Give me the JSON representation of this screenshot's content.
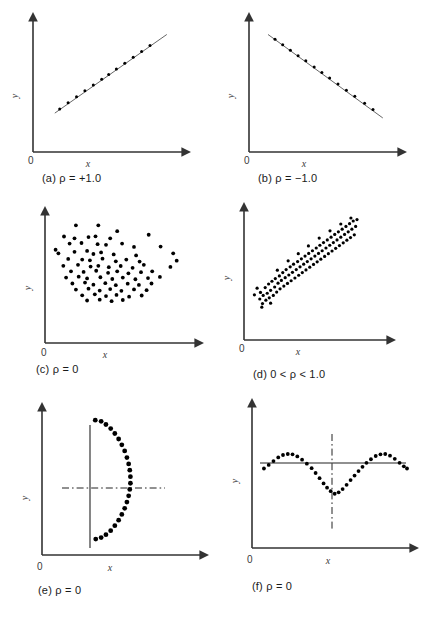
{
  "figure": {
    "title": "",
    "panel_count": 6
  },
  "chart_data": [
    {
      "type": "scatter",
      "panel": "a",
      "caption": "(a) ρ = +1.0",
      "title": "",
      "xlabel": "x",
      "ylabel": "y",
      "origin_label": "0",
      "grid": false,
      "legend": false,
      "has_trendline": true,
      "trendline": {
        "x0": 0.12,
        "y0": 0.28,
        "x1": 0.92,
        "y1": 0.93
      },
      "xlim": [
        0,
        1
      ],
      "ylim": [
        0,
        1
      ],
      "points": [
        [
          0.155,
          0.315
        ],
        [
          0.215,
          0.365
        ],
        [
          0.275,
          0.415
        ],
        [
          0.335,
          0.465
        ],
        [
          0.395,
          0.512
        ],
        [
          0.455,
          0.56
        ],
        [
          0.505,
          0.6
        ],
        [
          0.56,
          0.645
        ],
        [
          0.62,
          0.693
        ],
        [
          0.68,
          0.742
        ],
        [
          0.74,
          0.79
        ],
        [
          0.8,
          0.838
        ]
      ]
    },
    {
      "type": "scatter",
      "panel": "b",
      "caption": "(b) ρ = −1.0",
      "title": "",
      "xlabel": "x",
      "ylabel": "y",
      "origin_label": "0",
      "grid": false,
      "legend": false,
      "has_trendline": true,
      "trendline": {
        "x0": 0.1,
        "y0": 0.93,
        "x1": 0.92,
        "y1": 0.24
      },
      "xlim": [
        0,
        1
      ],
      "ylim": [
        0,
        1
      ],
      "points": [
        [
          0.15,
          0.89
        ],
        [
          0.205,
          0.845
        ],
        [
          0.26,
          0.8
        ],
        [
          0.315,
          0.755
        ],
        [
          0.37,
          0.712
        ],
        [
          0.43,
          0.662
        ],
        [
          0.485,
          0.616
        ],
        [
          0.54,
          0.57
        ],
        [
          0.6,
          0.52
        ],
        [
          0.66,
          0.47
        ],
        [
          0.72,
          0.42
        ],
        [
          0.79,
          0.362
        ],
        [
          0.85,
          0.31
        ]
      ]
    },
    {
      "type": "scatter",
      "panel": "c",
      "caption": "(c) ρ = 0",
      "title": "",
      "xlabel": "x",
      "ylabel": "y",
      "origin_label": "0",
      "grid": false,
      "legend": false,
      "has_trendline": false,
      "xlim": [
        0,
        1
      ],
      "ylim": [
        0,
        1
      ],
      "points": [
        [
          0.185,
          0.955
        ],
        [
          0.345,
          0.955
        ],
        [
          0.48,
          0.905
        ],
        [
          0.705,
          0.875
        ],
        [
          0.1,
          0.86
        ],
        [
          0.175,
          0.845
        ],
        [
          0.275,
          0.855
        ],
        [
          0.325,
          0.862
        ],
        [
          0.43,
          0.845
        ],
        [
          0.14,
          0.8
        ],
        [
          0.225,
          0.805
        ],
        [
          0.34,
          0.795
        ],
        [
          0.4,
          0.79
        ],
        [
          0.515,
          0.8
        ],
        [
          0.6,
          0.772
        ],
        [
          0.79,
          0.775
        ],
        [
          0.04,
          0.748
        ],
        [
          0.06,
          0.718
        ],
        [
          0.175,
          0.73
        ],
        [
          0.265,
          0.738
        ],
        [
          0.31,
          0.712
        ],
        [
          0.365,
          0.725
        ],
        [
          0.455,
          0.708
        ],
        [
          0.615,
          0.7
        ],
        [
          0.88,
          0.718
        ],
        [
          0.13,
          0.67
        ],
        [
          0.23,
          0.665
        ],
        [
          0.285,
          0.658
        ],
        [
          0.375,
          0.672
        ],
        [
          0.47,
          0.65
        ],
        [
          0.545,
          0.665
        ],
        [
          0.64,
          0.648
        ],
        [
          0.905,
          0.655
        ],
        [
          0.095,
          0.612
        ],
        [
          0.2,
          0.62
        ],
        [
          0.29,
          0.605
        ],
        [
          0.345,
          0.612
        ],
        [
          0.42,
          0.6
        ],
        [
          0.505,
          0.61
        ],
        [
          0.59,
          0.595
        ],
        [
          0.67,
          0.62
        ],
        [
          0.86,
          0.602
        ],
        [
          0.15,
          0.565
        ],
        [
          0.24,
          0.56
        ],
        [
          0.33,
          0.57
        ],
        [
          0.415,
          0.552
        ],
        [
          0.48,
          0.565
        ],
        [
          0.56,
          0.548
        ],
        [
          0.65,
          0.558
        ],
        [
          0.73,
          0.565
        ],
        [
          0.115,
          0.512
        ],
        [
          0.205,
          0.52
        ],
        [
          0.265,
          0.505
        ],
        [
          0.36,
          0.515
        ],
        [
          0.445,
          0.5
        ],
        [
          0.52,
          0.512
        ],
        [
          0.61,
          0.498
        ],
        [
          0.7,
          0.508
        ],
        [
          0.785,
          0.518
        ],
        [
          0.16,
          0.462
        ],
        [
          0.25,
          0.47
        ],
        [
          0.31,
          0.452
        ],
        [
          0.395,
          0.465
        ],
        [
          0.47,
          0.448
        ],
        [
          0.555,
          0.46
        ],
        [
          0.635,
          0.45
        ],
        [
          0.725,
          0.462
        ],
        [
          0.185,
          0.41
        ],
        [
          0.275,
          0.418
        ],
        [
          0.355,
          0.402
        ],
        [
          0.43,
          0.415
        ],
        [
          0.51,
          0.4
        ],
        [
          0.6,
          0.412
        ],
        [
          0.69,
          0.405
        ],
        [
          0.23,
          0.362
        ],
        [
          0.32,
          0.37
        ],
        [
          0.4,
          0.355
        ],
        [
          0.475,
          0.365
        ],
        [
          0.565,
          0.35
        ],
        [
          0.655,
          0.36
        ],
        [
          0.265,
          0.318
        ],
        [
          0.355,
          0.325
        ],
        [
          0.44,
          0.312
        ],
        [
          0.52,
          0.322
        ]
      ]
    },
    {
      "type": "scatter",
      "panel": "d",
      "caption": "(d) 0 < ρ < 1.0",
      "title": "",
      "xlabel": "x",
      "ylabel": "y",
      "origin_label": "0",
      "grid": false,
      "legend": false,
      "has_trendline": false,
      "correlation_range": "0 < rho < 1.0",
      "xlim": [
        0,
        1
      ],
      "ylim": [
        0,
        1
      ],
      "points": [
        [
          0.08,
          0.3
        ],
        [
          0.085,
          0.355
        ],
        [
          0.1,
          0.262
        ],
        [
          0.105,
          0.33
        ],
        [
          0.12,
          0.395
        ],
        [
          0.125,
          0.29
        ],
        [
          0.135,
          0.348
        ],
        [
          0.145,
          0.425
        ],
        [
          0.15,
          0.31
        ],
        [
          0.16,
          0.372
        ],
        [
          0.17,
          0.448
        ],
        [
          0.18,
          0.33
        ],
        [
          0.19,
          0.4
        ],
        [
          0.195,
          0.47
        ],
        [
          0.205,
          0.358
        ],
        [
          0.215,
          0.432
        ],
        [
          0.225,
          0.492
        ],
        [
          0.23,
          0.385
        ],
        [
          0.24,
          0.455
        ],
        [
          0.25,
          0.52
        ],
        [
          0.258,
          0.408
        ],
        [
          0.268,
          0.478
        ],
        [
          0.275,
          0.545
        ],
        [
          0.285,
          0.43
        ],
        [
          0.295,
          0.5
        ],
        [
          0.305,
          0.568
        ],
        [
          0.312,
          0.452
        ],
        [
          0.322,
          0.522
        ],
        [
          0.33,
          0.59
        ],
        [
          0.34,
          0.475
        ],
        [
          0.35,
          0.545
        ],
        [
          0.36,
          0.612
        ],
        [
          0.368,
          0.498
        ],
        [
          0.378,
          0.568
        ],
        [
          0.388,
          0.635
        ],
        [
          0.395,
          0.52
        ],
        [
          0.405,
          0.59
        ],
        [
          0.415,
          0.658
        ],
        [
          0.422,
          0.542
        ],
        [
          0.432,
          0.612
        ],
        [
          0.442,
          0.68
        ],
        [
          0.45,
          0.565
        ],
        [
          0.46,
          0.635
        ],
        [
          0.47,
          0.702
        ],
        [
          0.478,
          0.588
        ],
        [
          0.488,
          0.658
        ],
        [
          0.498,
          0.725
        ],
        [
          0.505,
          0.61
        ],
        [
          0.515,
          0.68
        ],
        [
          0.525,
          0.748
        ],
        [
          0.532,
          0.632
        ],
        [
          0.542,
          0.702
        ],
        [
          0.552,
          0.77
        ],
        [
          0.56,
          0.655
        ],
        [
          0.57,
          0.725
        ],
        [
          0.58,
          0.792
        ],
        [
          0.588,
          0.678
        ],
        [
          0.598,
          0.748
        ],
        [
          0.608,
          0.815
        ],
        [
          0.615,
          0.7
        ],
        [
          0.625,
          0.77
        ],
        [
          0.635,
          0.838
        ],
        [
          0.642,
          0.722
        ],
        [
          0.652,
          0.792
        ],
        [
          0.662,
          0.86
        ],
        [
          0.67,
          0.745
        ],
        [
          0.68,
          0.815
        ],
        [
          0.69,
          0.882
        ],
        [
          0.698,
          0.768
        ],
        [
          0.708,
          0.838
        ],
        [
          0.718,
          0.905
        ],
        [
          0.725,
          0.79
        ],
        [
          0.735,
          0.86
        ],
        [
          0.745,
          0.928
        ],
        [
          0.752,
          0.812
        ],
        [
          0.762,
          0.882
        ],
        [
          0.772,
          0.95
        ],
        [
          0.78,
          0.835
        ],
        [
          0.79,
          0.905
        ],
        [
          0.8,
          0.962
        ],
        [
          0.04,
          0.335
        ],
        [
          0.06,
          0.39
        ],
        [
          0.21,
          0.54
        ],
        [
          0.29,
          0.618
        ],
        [
          0.365,
          0.678
        ],
        [
          0.44,
          0.742
        ],
        [
          0.52,
          0.808
        ],
        [
          0.6,
          0.868
        ],
        [
          0.68,
          0.925
        ],
        [
          0.755,
          0.975
        ],
        [
          0.16,
          0.265
        ],
        [
          0.095,
          0.232
        ]
      ]
    },
    {
      "type": "scatter",
      "panel": "e",
      "caption": "(e) ρ = 0",
      "title": "",
      "xlabel": "x",
      "ylabel": "y",
      "origin_label": "0",
      "grid": false,
      "legend": false,
      "has_trendline": false,
      "shape": "vertical-parabolic-arc",
      "reference_lines": [
        {
          "kind": "vertical-solid",
          "x": 0.33
        },
        {
          "kind": "horizontal-dashdot",
          "y": 0.52
        }
      ],
      "xlim": [
        0,
        1
      ],
      "ylim": [
        0,
        1
      ],
      "points": [
        [
          0.335,
          0.93
        ],
        [
          0.372,
          0.922
        ],
        [
          0.402,
          0.9
        ],
        [
          0.432,
          0.872
        ],
        [
          0.458,
          0.838
        ],
        [
          0.482,
          0.8
        ],
        [
          0.502,
          0.76
        ],
        [
          0.52,
          0.718
        ],
        [
          0.534,
          0.672
        ],
        [
          0.545,
          0.628
        ],
        [
          0.552,
          0.585
        ],
        [
          0.556,
          0.54
        ],
        [
          0.556,
          0.495
        ],
        [
          0.552,
          0.452
        ],
        [
          0.545,
          0.408
        ],
        [
          0.534,
          0.365
        ],
        [
          0.52,
          0.322
        ],
        [
          0.502,
          0.28
        ],
        [
          0.482,
          0.24
        ],
        [
          0.458,
          0.202
        ],
        [
          0.432,
          0.168
        ],
        [
          0.402,
          0.14
        ],
        [
          0.372,
          0.12
        ],
        [
          0.338,
          0.11
        ]
      ]
    },
    {
      "type": "scatter",
      "panel": "f",
      "caption": "(f) ρ = 0",
      "title": "",
      "xlabel": "x",
      "ylabel": "y",
      "origin_label": "0",
      "grid": false,
      "legend": false,
      "has_trendline": false,
      "shape": "sine-like-wave",
      "reference_lines": [
        {
          "kind": "horizontal-solid",
          "y": 0.56
        },
        {
          "kind": "vertical-dashdot",
          "x": 0.52
        }
      ],
      "xlim": [
        0,
        1
      ],
      "ylim": [
        0,
        1
      ],
      "points": [
        [
          0.075,
          0.56
        ],
        [
          0.105,
          0.585
        ],
        [
          0.135,
          0.612
        ],
        [
          0.165,
          0.638
        ],
        [
          0.195,
          0.655
        ],
        [
          0.225,
          0.662
        ],
        [
          0.255,
          0.66
        ],
        [
          0.285,
          0.645
        ],
        [
          0.315,
          0.622
        ],
        [
          0.345,
          0.594
        ],
        [
          0.375,
          0.562
        ],
        [
          0.4,
          0.528
        ],
        [
          0.425,
          0.492
        ],
        [
          0.45,
          0.455
        ],
        [
          0.472,
          0.425
        ],
        [
          0.495,
          0.4
        ],
        [
          0.52,
          0.382
        ],
        [
          0.545,
          0.392
        ],
        [
          0.57,
          0.415
        ],
        [
          0.595,
          0.445
        ],
        [
          0.62,
          0.478
        ],
        [
          0.645,
          0.51
        ],
        [
          0.67,
          0.542
        ],
        [
          0.695,
          0.572
        ],
        [
          0.72,
          0.6
        ],
        [
          0.748,
          0.625
        ],
        [
          0.778,
          0.648
        ],
        [
          0.808,
          0.66
        ],
        [
          0.838,
          0.662
        ],
        [
          0.868,
          0.65
        ],
        [
          0.898,
          0.628
        ],
        [
          0.928,
          0.6
        ],
        [
          0.955,
          0.575
        ],
        [
          0.975,
          0.56
        ]
      ]
    }
  ]
}
